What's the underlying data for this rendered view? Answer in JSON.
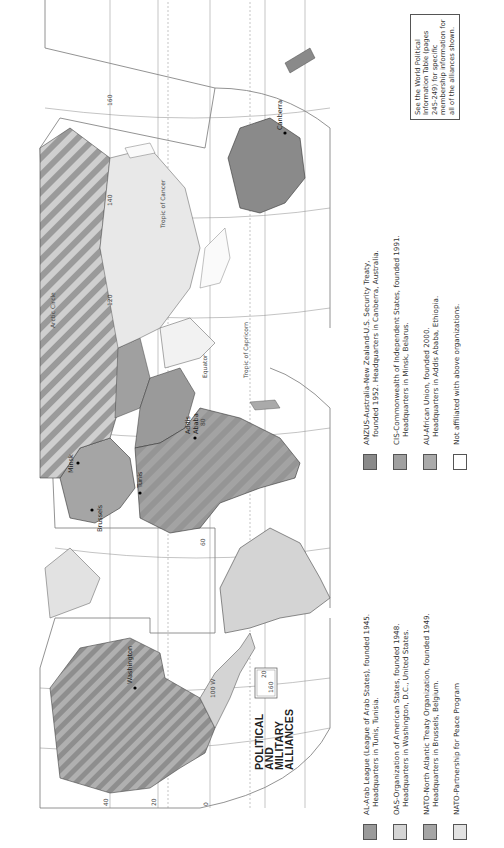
{
  "title": {
    "line1": "POLITICAL",
    "line2": "AND",
    "line3": "MILITARY",
    "line4": "ALLIANCES"
  },
  "legend": {
    "items": [
      {
        "swatch_color": "#9a9a9a",
        "line1": "AL-Arab League (League of Arab States), founded 1945.",
        "line2": "Headquarters in Tunis, Tunisia."
      },
      {
        "swatch_color": "#d4d4d4",
        "line1": "OAS-Organization of American States, founded 1948.",
        "line2": "Headquarters in Washington, D.C., United States."
      },
      {
        "swatch_color": "#a5a5a5",
        "line1": "NATO-North Atlantic Treaty Organization, founded 1949.",
        "line2": "Headquarters in Brussels, Belgium."
      },
      {
        "swatch_color": "#e2e2e2",
        "line1": "NATO-Partnership for Peace Program",
        "line2": ""
      },
      {
        "swatch_color": "#8a8a8a",
        "line1": "ANZUS-Australia-New Zealand-U.S. Security Treaty,",
        "line2": "founded 1952.  Headquarters in Canberra, Australia."
      },
      {
        "swatch_color": "#a0a0a0",
        "line1": "CIS-Commonwealth of Independent States, founded 1991.",
        "line2": "Headquarters in Minsk, Belarus."
      },
      {
        "swatch_color": "#aaaaaa",
        "line1": "AU-African Union, founded 2000.",
        "line2": "Headquarters in Addis Ababa, Ethiopia."
      },
      {
        "swatch_color": "#ffffff",
        "line1": "Not affiliated with above organizations.",
        "line2": ""
      }
    ]
  },
  "note": {
    "text": "See the World Political Information Table (pages 245-249) for specific membership information for all of the alliances shown."
  },
  "map": {
    "cities": {
      "washington": "Washington",
      "brussels": "Brussels",
      "tunis": "Tunis",
      "minsk": "Minsk",
      "addis_ababa_1": "Addis",
      "addis_ababa_2": "Ababa",
      "canberra": "Canberra"
    },
    "labels": {
      "equator": "Equator",
      "tropic_cancer": "Tropic of Cancer",
      "tropic_capricorn": "Tropic of Capricorn",
      "arctic_circle": "Arctic Circle",
      "lon_100w": "100 W",
      "lat_160": "160",
      "lat_140": "140",
      "lat_120": "120",
      "lat_80": "80",
      "lat_60": "60",
      "lat_40": "40",
      "lat_20": "20",
      "lat_0": "0",
      "inset_160": "160",
      "inset_20": "20"
    },
    "colors": {
      "al": "#9a9a9a",
      "oas": "#d4d4d4",
      "nato": "#a5a5a5",
      "pfp": "#e2e2e2",
      "anzus": "#8a8a8a",
      "cis": "#a0a0a0",
      "au": "#aaaaaa",
      "none": "#ffffff",
      "grid": "#777777"
    }
  }
}
